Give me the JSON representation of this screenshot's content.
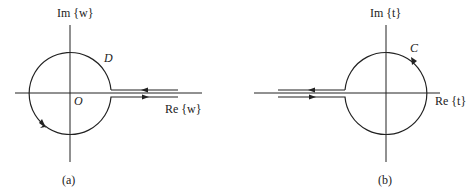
{
  "panels": [
    {
      "id": "a",
      "caption": "(a)",
      "im_axis_label": "Im {w}",
      "re_axis_label": "Re {w}",
      "contour_label": "D",
      "origin_label": "O"
    },
    {
      "id": "b",
      "caption": "(b)",
      "im_axis_label": "Im {t}",
      "re_axis_label": "Re {t}",
      "contour_label": "C"
    }
  ],
  "colors": {
    "line": "#222222",
    "background": "#ffffff"
  }
}
